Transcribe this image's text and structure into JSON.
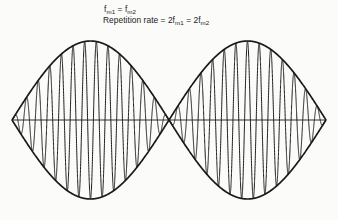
{
  "figure": {
    "background_color": "#fbfbfa",
    "ink_color": "#1a1a1a"
  },
  "annotations": {
    "line1": {
      "text": "f_m1 = f_m2",
      "parts": [
        "f",
        "m1",
        " = ",
        "f",
        "m2"
      ]
    },
    "line2": {
      "text": "Repetition rate = 2f_m1 = 2f_m2",
      "parts": [
        "Repetition rate = 2f",
        "m1",
        " = 2f",
        "m2"
      ]
    },
    "labels": {
      "f": "f",
      "sub_m1": "m1",
      "sub_m2": "m2",
      "equals": " = ",
      "repetition_rate": "Repetition rate = 2f",
      "equals_two": " = 2f"
    }
  },
  "chart_data": {
    "type": "line",
    "title": "",
    "xlabel": "",
    "ylabel": "",
    "grid": false,
    "legend": false,
    "axis": {
      "show_center_line": true,
      "center_line_y_px": 120,
      "x_start_px": 12,
      "x_end_px": 326
    },
    "envelope": {
      "shape": "abs-sine",
      "lobes": 2,
      "peak_top_px": 41,
      "peak_bottom_px": 200,
      "amplitude_px": 79,
      "node_positions_px": [
        12,
        169,
        326
      ],
      "peak_positions_px": [
        90.5,
        247.5
      ]
    },
    "carrier": {
      "cycles_per_lobe": 13.5,
      "total_cycles": 27,
      "line_width_px": 1.0
    },
    "series": [
      {
        "name": "beat waveform",
        "formula": "y = A * |sin(pi * x / L)| * sin(2 * pi * N * x / L)",
        "A": 79,
        "L": 157,
        "N": 13.5,
        "color": "#1a1a1a"
      },
      {
        "name": "upper envelope",
        "formula": "y = +A * |sin(pi * x / L)|",
        "color": "#1a1a1a"
      },
      {
        "name": "lower envelope",
        "formula": "y = -A * |sin(pi * x / L)|",
        "color": "#1a1a1a"
      }
    ],
    "xlim": [
      12,
      326
    ],
    "ylim": [
      -79,
      79
    ]
  }
}
